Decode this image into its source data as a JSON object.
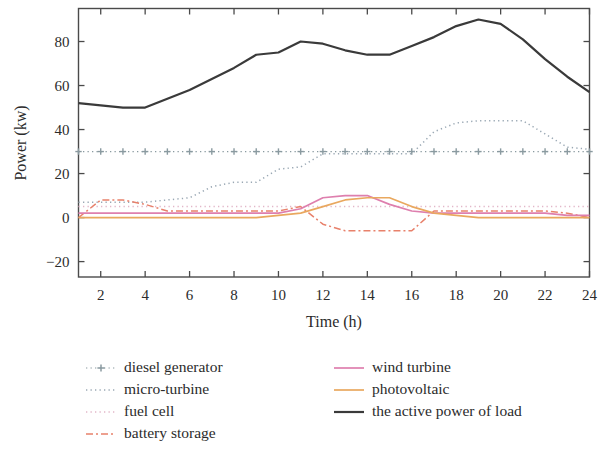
{
  "chart_data": {
    "type": "line",
    "title": "",
    "xlabel": "Time (h)",
    "ylabel": "Power (kw)",
    "xlim": [
      1,
      24
    ],
    "ylim": [
      -27,
      95
    ],
    "xticks": [
      2,
      4,
      6,
      8,
      10,
      12,
      14,
      16,
      18,
      20,
      22,
      24
    ],
    "yticks": [
      -20,
      0,
      20,
      40,
      60,
      80
    ],
    "grid": false,
    "legend_position": "below-axes, two columns",
    "x": [
      1,
      2,
      3,
      4,
      5,
      6,
      7,
      8,
      9,
      10,
      11,
      12,
      13,
      14,
      15,
      16,
      17,
      18,
      19,
      20,
      21,
      22,
      23,
      24
    ],
    "series": [
      {
        "name": "diesel generator",
        "color": "#8a9aa0",
        "style": "dotted-with-plus-markers",
        "values": [
          30,
          30,
          30,
          30,
          30,
          30,
          30,
          30,
          30,
          30,
          30,
          30,
          30,
          30,
          30,
          30,
          30,
          30,
          30,
          30,
          30,
          30,
          30,
          30
        ]
      },
      {
        "name": "micro-turbine",
        "color": "#9aa8b4",
        "style": "dotted",
        "values": [
          7,
          7,
          7,
          7,
          8,
          9,
          14,
          16,
          16,
          22,
          23,
          29,
          29,
          29,
          29,
          29,
          39,
          43,
          44,
          44,
          44,
          38,
          32,
          31
        ]
      },
      {
        "name": "fuel cell",
        "color": "#e2b6c8",
        "style": "dotted",
        "values": [
          5,
          5,
          5,
          5,
          5,
          5,
          5,
          5,
          5,
          5,
          5,
          5,
          5,
          5,
          5,
          5,
          5,
          5,
          5,
          5,
          5,
          5,
          5,
          5
        ]
      },
      {
        "name": "battery storage",
        "color": "#e8816b",
        "style": "dash-dot",
        "values": [
          0,
          8,
          8,
          6,
          3,
          3,
          3,
          3,
          3,
          3,
          5,
          -3,
          -6,
          -6,
          -6,
          -6,
          3,
          3,
          3,
          3,
          3,
          3,
          2,
          0
        ]
      },
      {
        "name": "wind turbine",
        "color": "#de7fae",
        "style": "solid",
        "values": [
          2,
          2,
          2,
          2,
          2,
          2,
          2,
          2,
          2,
          2,
          4,
          9,
          10,
          10,
          6,
          3,
          2,
          2,
          2,
          2,
          2,
          2,
          1,
          1
        ]
      },
      {
        "name": "photovoltaic",
        "color": "#e9a85f",
        "style": "solid",
        "values": [
          0,
          0,
          0,
          0,
          0,
          0,
          0,
          0,
          0,
          1,
          2,
          5,
          8,
          9,
          9,
          5,
          2,
          1,
          0,
          0,
          0,
          0,
          0,
          0
        ]
      },
      {
        "name": "the active power of load",
        "color": "#3a3a3a",
        "style": "solid-thick",
        "values": [
          52,
          51,
          50,
          50,
          54,
          58,
          63,
          68,
          74,
          75,
          80,
          79,
          76,
          74,
          74,
          78,
          82,
          87,
          90,
          88,
          81,
          72,
          64,
          57
        ]
      }
    ]
  },
  "legend": {
    "column1": [
      {
        "label": "diesel generator",
        "marker": "dotted-plus-line-icon"
      },
      {
        "label": "micro-turbine",
        "marker": "dotted-line-icon"
      },
      {
        "label": "fuel cell",
        "marker": "dotted-line-icon"
      },
      {
        "label": "battery storage",
        "marker": "dash-dot-line-icon"
      }
    ],
    "column2": [
      {
        "label": "wind turbine",
        "marker": "solid-line-icon"
      },
      {
        "label": "photovoltaic",
        "marker": "solid-line-icon"
      },
      {
        "label": "the active power of load",
        "marker": "solid-thick-line-icon"
      }
    ]
  },
  "axes": {
    "y_title": "Power (kw)",
    "x_title": "Time (h)",
    "y_tick_labels": [
      "80",
      "60",
      "40",
      "20",
      "0",
      "−20"
    ],
    "x_tick_labels": [
      "2",
      "4",
      "6",
      "8",
      "10",
      "12",
      "14",
      "16",
      "18",
      "20",
      "22",
      "24"
    ]
  }
}
